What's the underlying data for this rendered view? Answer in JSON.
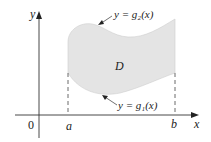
{
  "diagram": {
    "type": "region-between-curves",
    "region_label": "D",
    "upper_curve_label": "y = g₂(x)",
    "lower_curve_label": "y = g₁(x)",
    "axis_labels": {
      "x": "x",
      "y": "y",
      "origin": "0"
    },
    "bound_labels": {
      "left": "a",
      "right": "b"
    },
    "colors": {
      "fill": "#e4e4e4",
      "axis": "#333333",
      "edge": "#c8c8c8",
      "text": "#222222"
    }
  }
}
